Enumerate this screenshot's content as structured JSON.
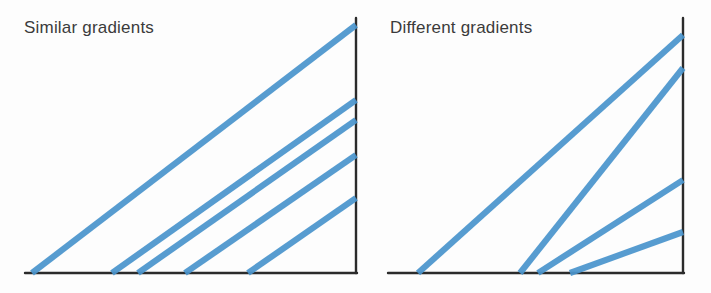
{
  "figure": {
    "background_color": "#fdfdfd",
    "line_color": "#4a95cc",
    "axis_color": "#2b2b2b",
    "width": 711,
    "height": 293
  },
  "panels": [
    {
      "id": "similar",
      "title": "Similar gradients",
      "axes": {
        "baseline_y": 273,
        "baseline_x_start": 25,
        "baseline_x_end": 357,
        "vertical_x": 356,
        "vertical_y_top": 18,
        "vertical_y_bottom": 273
      },
      "lines": [
        {
          "name": "line-1",
          "x1": 32,
          "y1": 273,
          "x2": 356,
          "y2": 25
        },
        {
          "name": "line-2",
          "x1": 112,
          "y1": 273,
          "x2": 356,
          "y2": 100
        },
        {
          "name": "line-3",
          "x1": 138,
          "y1": 273,
          "x2": 356,
          "y2": 120
        },
        {
          "name": "line-4",
          "x1": 185,
          "y1": 273,
          "x2": 356,
          "y2": 155
        },
        {
          "name": "line-5",
          "x1": 248,
          "y1": 273,
          "x2": 356,
          "y2": 198
        }
      ]
    },
    {
      "id": "different",
      "title": "Different gradients",
      "axes": {
        "baseline_y": 273,
        "baseline_x_start": 388,
        "baseline_x_end": 684,
        "vertical_x": 683,
        "vertical_y_top": 18,
        "vertical_y_bottom": 273
      },
      "lines": [
        {
          "name": "line-1",
          "x1": 418,
          "y1": 273,
          "x2": 683,
          "y2": 35
        },
        {
          "name": "line-2",
          "x1": 520,
          "y1": 273,
          "x2": 683,
          "y2": 68
        },
        {
          "name": "line-3",
          "x1": 538,
          "y1": 273,
          "x2": 683,
          "y2": 180
        },
        {
          "name": "line-4",
          "x1": 570,
          "y1": 273,
          "x2": 683,
          "y2": 232
        }
      ]
    }
  ],
  "chart_data": {
    "type": "line",
    "title": "",
    "subtitle": "",
    "xlabel": "",
    "ylabel": "",
    "grid": false,
    "legend": "none",
    "panels": [
      {
        "title": "Similar gradients",
        "description": "Five straight blue lines of nearly equal slope rising left-to-right from the horizontal axis to the vertical axis",
        "series": [
          {
            "name": "line-1",
            "gradient": 0.77,
            "x_intercept": 32,
            "y_at_right_axis": 248
          },
          {
            "name": "line-2",
            "gradient": 0.71,
            "x_intercept": 112,
            "y_at_right_axis": 173
          },
          {
            "name": "line-3",
            "gradient": 0.7,
            "x_intercept": 138,
            "y_at_right_axis": 153
          },
          {
            "name": "line-4",
            "gradient": 0.69,
            "x_intercept": 185,
            "y_at_right_axis": 118
          },
          {
            "name": "line-5",
            "gradient": 0.69,
            "x_intercept": 248,
            "y_at_right_axis": 75
          }
        ]
      },
      {
        "title": "Different gradients",
        "description": "Four straight blue lines of clearly different slopes fanning out from the horizontal axis to the vertical axis",
        "series": [
          {
            "name": "line-1",
            "gradient": 0.9,
            "x_intercept": 418,
            "y_at_right_axis": 238
          },
          {
            "name": "line-2",
            "gradient": 1.26,
            "x_intercept": 520,
            "y_at_right_axis": 205
          },
          {
            "name": "line-3",
            "gradient": 0.64,
            "x_intercept": 538,
            "y_at_right_axis": 93
          },
          {
            "name": "line-4",
            "gradient": 0.36,
            "x_intercept": 570,
            "y_at_right_axis": 41
          }
        ]
      }
    ]
  }
}
